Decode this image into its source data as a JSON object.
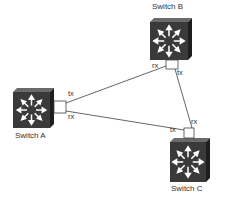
{
  "diagram": {
    "switches": [
      {
        "id": "A",
        "label": "Switch A"
      },
      {
        "id": "B",
        "label": "Switch B"
      },
      {
        "id": "C",
        "label": "Switch C"
      }
    ],
    "links": [
      {
        "from": "A",
        "to": "B",
        "from_port": "tx",
        "to_port": "rx"
      },
      {
        "from": "A",
        "to": "C",
        "from_port": "rx",
        "to_port": "tx"
      },
      {
        "from": "B",
        "to": "C",
        "from_port": "tx",
        "to_port": "rx"
      }
    ],
    "port_labels": {
      "a_top": "tx",
      "a_bottom": "rx",
      "b_left": "rx",
      "b_right": "tx",
      "c_left": "tx",
      "c_right": "rx"
    },
    "colors": {
      "switch_face": "#3a3a3a",
      "switch_top": "#6a6a6a",
      "switch_side": "#1e1e1e",
      "arrow": "#ffffff",
      "line": "#555555"
    }
  }
}
